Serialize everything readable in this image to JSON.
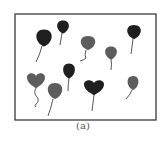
{
  "figure": {
    "caption": "(a)",
    "frame": {
      "x": 15,
      "y": 14,
      "width": 141,
      "height": 106,
      "stroke": "#3a3a3a"
    },
    "colors": {
      "dark": "#1f1f1f",
      "gray": "#5c5c5c",
      "string": "#444444"
    },
    "balloons": [
      {
        "id": 1,
        "shape": "round",
        "tone": "dark",
        "cx": 44,
        "cy": 38,
        "rx": 8.5,
        "ry": 8.5,
        "string": "M42 46 Q40 54 36 62"
      },
      {
        "id": 2,
        "shape": "round",
        "tone": "dark",
        "cx": 63,
        "cy": 27,
        "rx": 6.5,
        "ry": 6.5,
        "string": "M62 33 Q61 39 60 45"
      },
      {
        "id": 3,
        "shape": "round",
        "tone": "gray",
        "cx": 88,
        "cy": 43,
        "rx": 8,
        "ry": 7,
        "string": "M86 50 Q84 56 86 58 Q84 60 80 61"
      },
      {
        "id": 4,
        "shape": "round",
        "tone": "gray",
        "cx": 111,
        "cy": 53,
        "rx": 6.5,
        "ry": 6.5,
        "string": "M111 59 Q112 64 111 70"
      },
      {
        "id": 5,
        "shape": "round",
        "tone": "dark",
        "cx": 134,
        "cy": 32,
        "rx": 7.5,
        "ry": 7,
        "string": "M133 39 Q132 47 131 54"
      },
      {
        "id": 6,
        "shape": "heart",
        "tone": "gray",
        "cx": 36,
        "cy": 80,
        "w": 18,
        "h": 15,
        "string": "M36 88 Q33 93 37 97 Q40 101 36 104 Q34 106 36 107"
      },
      {
        "id": 7,
        "shape": "round",
        "tone": "gray",
        "cx": 55,
        "cy": 91,
        "rx": 8,
        "ry": 8,
        "string": "M53 99 Q51 108 48 116"
      },
      {
        "id": 8,
        "shape": "round",
        "tone": "dark",
        "cx": 69,
        "cy": 71,
        "rx": 6.5,
        "ry": 7.5,
        "string": "M69 78 Q68 85 68 91"
      },
      {
        "id": 9,
        "shape": "heart",
        "tone": "dark",
        "cx": 94,
        "cy": 87,
        "w": 20,
        "h": 15,
        "string": "M94 95 Q93 103 92 111"
      },
      {
        "id": 10,
        "shape": "round",
        "tone": "gray",
        "cx": 133,
        "cy": 83,
        "rx": 6,
        "ry": 7,
        "string": "M132 90 Q130 95 126 99"
      }
    ]
  }
}
